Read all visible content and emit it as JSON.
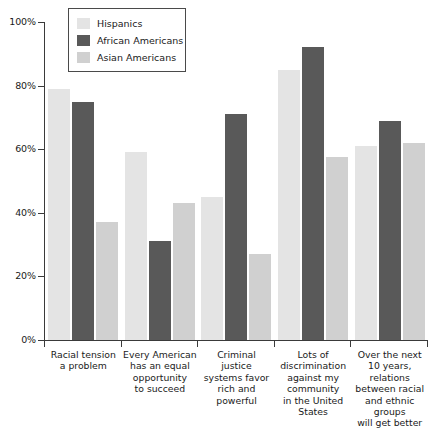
{
  "chart_data": {
    "type": "bar",
    "title": "",
    "subtitle": "",
    "xlabel": "",
    "ylabel": "",
    "ylim": [
      0,
      100
    ],
    "y_ticks": [
      "0%",
      "20%",
      "40%",
      "60%",
      "80%",
      "100%"
    ],
    "y_tick_values": [
      0,
      20,
      40,
      60,
      80,
      100
    ],
    "grid": false,
    "legend_position": "top-left",
    "categories": [
      "Racial tension\na problem",
      "Every American\nhas an equal\nopportunity\nto succeed",
      "Criminal\njustice\nsystems favor\nrich and\npowerful",
      "Lots of\ndiscrimination\nagainst my\ncommunity\nin the United\nStates",
      "Over the next\n10 years,\nrelations\nbetween racial\nand ethnic\ngroups\nwill get better"
    ],
    "category_lines": [
      [
        "Racial tension",
        "a problem"
      ],
      [
        "Every American",
        "has an equal",
        "opportunity",
        "to succeed"
      ],
      [
        "Criminal",
        "justice",
        "systems favor",
        "rich and",
        "powerful"
      ],
      [
        "Lots of",
        "discrimination",
        "against my",
        "community",
        "in the United",
        "States"
      ],
      [
        "Over the next",
        "10 years,",
        "relations",
        "between racial",
        "and ethnic",
        "groups",
        "will get better"
      ]
    ],
    "series": [
      {
        "name": "Hispanics",
        "color": "#e4e4e4",
        "values": [
          79,
          59,
          45,
          85,
          61
        ]
      },
      {
        "name": "African Americans",
        "color": "#595959",
        "values": [
          75,
          31,
          71,
          92,
          69
        ]
      },
      {
        "name": "Asian Americans",
        "color": "#d0d0d0",
        "values": [
          37,
          43,
          27,
          57.5,
          62
        ]
      }
    ]
  },
  "legend": {
    "entries": [
      {
        "label": "Hispanics",
        "color": "#e4e4e4"
      },
      {
        "label": "African Americans",
        "color": "#595959"
      },
      {
        "label": "Asian Americans",
        "color": "#d0d0d0"
      }
    ]
  },
  "axis": {
    "y_labels": [
      "100%",
      "80%",
      "60%",
      "40%",
      "20%",
      "0%"
    ],
    "axis_color": "#3a3a3a"
  }
}
